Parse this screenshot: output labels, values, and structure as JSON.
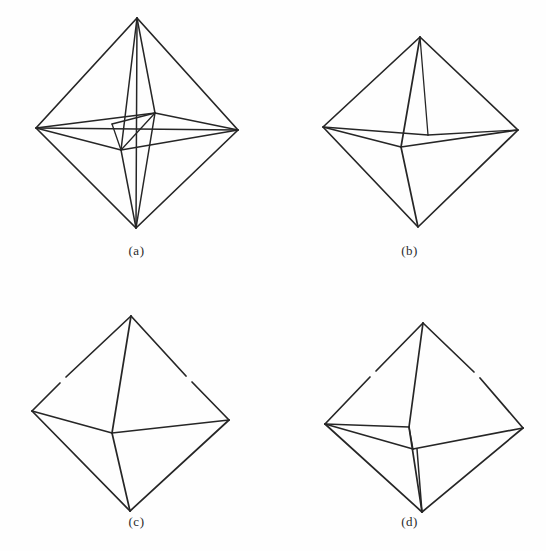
{
  "figure": {
    "background_color": "#fefefe",
    "line_color": "#262626",
    "panels": [
      {
        "id": "a",
        "caption": "(a)",
        "description": "octahedron wireframe with all hidden edges shown and inner nested octahedron",
        "shape": "octahedron",
        "hidden_edges_visible": true,
        "inner_solid": true
      },
      {
        "id": "b",
        "caption": "(b)",
        "description": "octahedron with hidden edges removed, front vertex edges visible",
        "shape": "octahedron",
        "hidden_edges_visible": false,
        "inner_solid": false
      },
      {
        "id": "c",
        "caption": "(c)",
        "description": "octahedron outline with single front vertex edges",
        "shape": "octahedron",
        "hidden_edges_visible": false,
        "inner_solid": false
      },
      {
        "id": "d",
        "caption": "(d)",
        "description": "octahedron with front and rear middle vertices and double vertical edges",
        "shape": "octahedron",
        "hidden_edges_visible": false,
        "inner_solid": false
      }
    ]
  }
}
